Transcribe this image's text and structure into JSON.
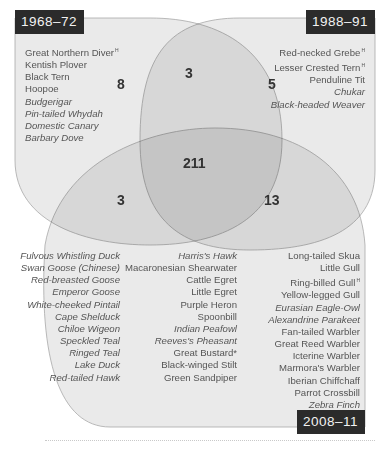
{
  "sets": {
    "a": {
      "label": "1968–72",
      "exclusive_count": "8",
      "species": [
        {
          "name": "Great Northern Diver",
          "italic": false,
          "sup": "H"
        },
        {
          "name": "Kentish Plover",
          "italic": false,
          "sup": ""
        },
        {
          "name": "Black Tern",
          "italic": false,
          "sup": ""
        },
        {
          "name": "Hoopoe",
          "italic": false,
          "sup": ""
        },
        {
          "name": "Budgerigar",
          "italic": true,
          "sup": ""
        },
        {
          "name": "Pin-tailed Whydah",
          "italic": true,
          "sup": ""
        },
        {
          "name": "Domestic Canary",
          "italic": true,
          "sup": ""
        },
        {
          "name": "Barbary Dove",
          "italic": true,
          "sup": ""
        }
      ]
    },
    "b": {
      "label": "1988–91",
      "exclusive_count": "5",
      "species": [
        {
          "name": "Red-necked Grebe",
          "italic": false,
          "sup": "H"
        },
        {
          "name": "Lesser Crested Tern",
          "italic": false,
          "sup": "H"
        },
        {
          "name": "Penduline Tit",
          "italic": false,
          "sup": ""
        },
        {
          "name": "Chukar",
          "italic": true,
          "sup": ""
        },
        {
          "name": "Black-headed Weaver",
          "italic": true,
          "sup": ""
        }
      ]
    },
    "c": {
      "label": "2008–11",
      "exclusive_count": "13"
    }
  },
  "intersections": {
    "ab_only": "3",
    "ac_only": "3",
    "bc_only": "13",
    "abc": "211"
  },
  "bottom_columns": [
    [
      {
        "name": "Fulvous Whistling Duck",
        "italic": true,
        "sup": ""
      },
      {
        "name": "Swan Goose (Chinese)",
        "italic": true,
        "sup": ""
      },
      {
        "name": "Red-breasted Goose",
        "italic": true,
        "sup": ""
      },
      {
        "name": "Emperor Goose",
        "italic": true,
        "sup": ""
      },
      {
        "name": "White-cheeked Pintail",
        "italic": true,
        "sup": ""
      },
      {
        "name": "Cape Shelduck",
        "italic": true,
        "sup": ""
      },
      {
        "name": "Chiloe Wigeon",
        "italic": true,
        "sup": ""
      },
      {
        "name": "Speckled Teal",
        "italic": true,
        "sup": ""
      },
      {
        "name": "Ringed Teal",
        "italic": true,
        "sup": ""
      },
      {
        "name": "Lake Duck",
        "italic": true,
        "sup": ""
      },
      {
        "name": "Red-tailed Hawk",
        "italic": true,
        "sup": ""
      }
    ],
    [
      {
        "name": "Harris's Hawk",
        "italic": true,
        "sup": ""
      },
      {
        "name": "Macaronesian Shearwater",
        "italic": false,
        "sup": ""
      },
      {
        "name": "Cattle Egret",
        "italic": false,
        "sup": ""
      },
      {
        "name": "Little Egret",
        "italic": false,
        "sup": ""
      },
      {
        "name": "Purple Heron",
        "italic": false,
        "sup": ""
      },
      {
        "name": "Spoonbill",
        "italic": false,
        "sup": ""
      },
      {
        "name": "Indian Peafowl",
        "italic": true,
        "sup": ""
      },
      {
        "name": "Reeves's Pheasant",
        "italic": true,
        "sup": ""
      },
      {
        "name": "Great Bustard*",
        "italic": false,
        "sup": ""
      },
      {
        "name": "Black-winged Stilt",
        "italic": false,
        "sup": ""
      },
      {
        "name": "Green Sandpiper",
        "italic": false,
        "sup": ""
      }
    ],
    [
      {
        "name": "Long-tailed Skua",
        "italic": false,
        "sup": ""
      },
      {
        "name": "Little Gull",
        "italic": false,
        "sup": ""
      },
      {
        "name": "Ring-billed Gull",
        "italic": false,
        "sup": "H"
      },
      {
        "name": "Yellow-legged Gull",
        "italic": false,
        "sup": ""
      },
      {
        "name": "Eurasian Eagle-Owl",
        "italic": true,
        "sup": ""
      },
      {
        "name": "Alexandrine Parakeet",
        "italic": true,
        "sup": ""
      },
      {
        "name": "Fan-tailed Warbler",
        "italic": false,
        "sup": ""
      },
      {
        "name": "Great Reed Warbler",
        "italic": false,
        "sup": ""
      },
      {
        "name": "Icterine Warbler",
        "italic": false,
        "sup": ""
      },
      {
        "name": "Marmora's Warbler",
        "italic": false,
        "sup": ""
      },
      {
        "name": "Iberian Chiffchaff",
        "italic": false,
        "sup": ""
      },
      {
        "name": "Parrot Crossbill",
        "italic": false,
        "sup": ""
      },
      {
        "name": "Zebra Finch",
        "italic": true,
        "sup": ""
      }
    ]
  ],
  "colors": {
    "label_bg": "#2b2b2b",
    "label_text": "#f2f2f2",
    "set_fill": "#e4e4e4",
    "set_stroke": "#a8a8a8"
  }
}
